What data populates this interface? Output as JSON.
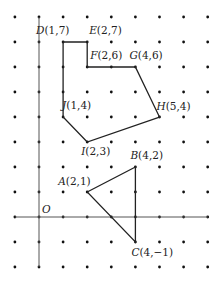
{
  "figure": {
    "grid": {
      "x_min": -1,
      "x_max": 7,
      "y_min": -2,
      "y_max": 8,
      "origin_px": [
        39,
        217
      ],
      "spacing_px": 24.6
    },
    "origin_label": "O",
    "axes": {
      "x_axis_from": -1,
      "x_axis_to": 7,
      "y_axis_from": -2,
      "y_axis_to": 8
    },
    "points": [
      {
        "name": "A",
        "label": "A(2,1)",
        "x": 2,
        "y": 1
      },
      {
        "name": "B",
        "label": "B(4,2)",
        "x": 4,
        "y": 2
      },
      {
        "name": "C",
        "label": "C(4,−1)",
        "x": 4,
        "y": -1
      },
      {
        "name": "D",
        "label": "D(1,7)",
        "x": 1,
        "y": 7
      },
      {
        "name": "E",
        "label": "E(2,7)",
        "x": 2,
        "y": 7
      },
      {
        "name": "F",
        "label": "F(2,6)",
        "x": 2,
        "y": 6
      },
      {
        "name": "G",
        "label": "G(4,6)",
        "x": 4,
        "y": 6
      },
      {
        "name": "H",
        "label": "H(5,4)",
        "x": 5,
        "y": 4
      },
      {
        "name": "I",
        "label": "I(2,3)",
        "x": 2,
        "y": 3
      },
      {
        "name": "J",
        "label": "J(1,4)",
        "x": 1,
        "y": 4
      }
    ],
    "triangle": [
      "A",
      "B",
      "C"
    ],
    "polygon": [
      "D",
      "E",
      "F",
      "G",
      "H",
      "I",
      "J"
    ],
    "colors": {
      "line": "#222222",
      "dot": "#111111",
      "axis": "#555555"
    }
  }
}
